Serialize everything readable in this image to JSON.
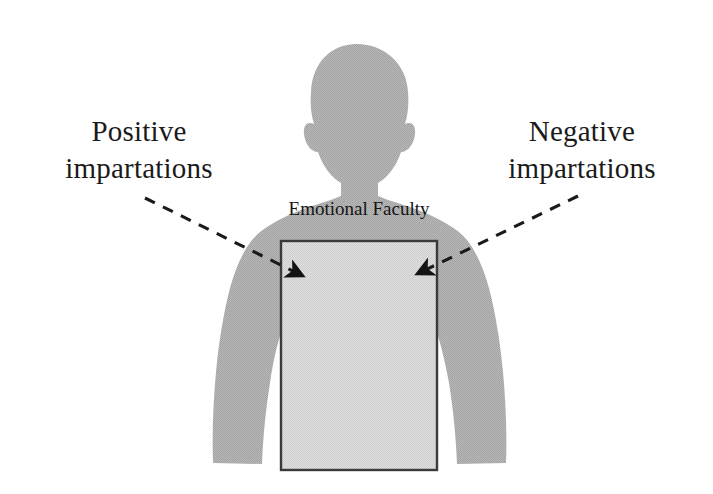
{
  "figure": {
    "background_color": "#ffffff",
    "body_fill_color": "#b4b4b4",
    "region_fill_color": "#d6d6d6",
    "region_stroke_color": "#333333",
    "line_color": "#1a1a1a",
    "text_color": "#1a1a1a"
  },
  "callout_left": {
    "name": "positive-impartations",
    "line1": "Positive",
    "line2": "impartations"
  },
  "callout_right": {
    "name": "negative-impartations",
    "line1": "Negative",
    "line2": "impartations"
  },
  "region": {
    "label": "Emotional Faculty"
  },
  "silhouette": {
    "name": "human-torso-silhouette",
    "description": "gray headshot silhouette with shoulders and arms"
  },
  "connectors": [
    {
      "name": "left-dashed-arrow",
      "from": "Positive impartations",
      "to": "Emotional Faculty region",
      "style": "dashed",
      "arrowhead": "filled-triangle"
    },
    {
      "name": "right-dashed-arrow",
      "from": "Negative impartations",
      "to": "Emotional Faculty region",
      "style": "dashed",
      "arrowhead": "filled-triangle"
    }
  ]
}
